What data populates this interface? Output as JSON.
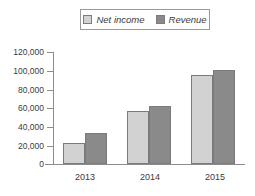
{
  "chart_data": {
    "type": "bar",
    "title": "",
    "xlabel": "",
    "ylabel": "",
    "categories": [
      "2013",
      "2014",
      "2015"
    ],
    "series": [
      {
        "name": "Net income",
        "color": "#d2d2d2",
        "values": [
          23000,
          57000,
          95000
        ]
      },
      {
        "name": "Revenue",
        "color": "#8a8a8a",
        "values": [
          33000,
          62000,
          101000
        ]
      }
    ],
    "ylim": [
      0,
      120000
    ],
    "ytick_values": [
      0,
      20000,
      40000,
      60000,
      80000,
      100000,
      120000
    ],
    "ytick_labels": [
      "0",
      "20,000",
      "40,000",
      "60,000",
      "80,000",
      "100,000",
      "120,000"
    ],
    "grid": false,
    "legend_position": "top-center",
    "annotations": []
  },
  "legend": {
    "entries": [
      {
        "label": "Net income",
        "swatch": "series-light"
      },
      {
        "label": "Revenue",
        "swatch": "series-dark"
      }
    ]
  },
  "axes": {
    "y_labels": [
      "120,000",
      "100,000",
      "80,000",
      "60,000",
      "40,000",
      "20,000",
      "0"
    ],
    "x_labels": [
      "2013",
      "2014",
      "2015"
    ]
  },
  "colors": {
    "series_light": "#d2d2d2",
    "series_dark": "#8a8a8a",
    "axis": "#8c8c8c",
    "text": "#3b3b3b",
    "background": "#ffffff"
  }
}
